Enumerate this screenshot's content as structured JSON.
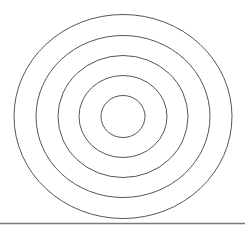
{
  "diagram": {
    "type": "concentric-ellipses",
    "background": "#ffffff",
    "stroke_color": "#555555",
    "stroke_width": 1,
    "center": {
      "x": 123,
      "y": 116.5
    },
    "rings": [
      {
        "rx": 109,
        "ry": 102
      },
      {
        "rx": 87,
        "ry": 81
      },
      {
        "rx": 65,
        "ry": 61
      },
      {
        "rx": 44,
        "ry": 41
      },
      {
        "rx": 22,
        "ry": 21
      }
    ],
    "baseline": {
      "y": 223.5,
      "x1": 0,
      "x2": 245,
      "color": "#7a7a7a",
      "width": 1.5
    }
  }
}
